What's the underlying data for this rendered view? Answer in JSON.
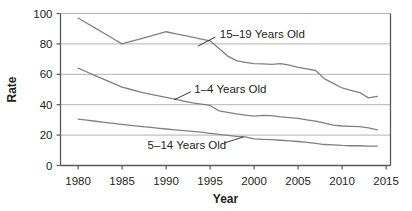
{
  "chart_data": {
    "type": "line",
    "title": "",
    "xlabel": "Year",
    "ylabel": "Rate",
    "xlim": [
      1978,
      2015.5
    ],
    "ylim": [
      0,
      100
    ],
    "xticks": [
      1980,
      1985,
      1990,
      1995,
      2000,
      2005,
      2010,
      2015
    ],
    "xtick_labels": [
      "1980",
      "1985",
      "1990",
      "1995",
      "2000",
      "2005",
      "2010",
      "2015"
    ],
    "yticks": [
      0,
      20,
      40,
      60,
      80,
      100
    ],
    "ytick_labels": [
      "0",
      "20",
      "40",
      "60",
      "80",
      "100"
    ],
    "grid": "horizontal",
    "legend_position": "inline-annotations",
    "line_color": "#808080",
    "grid_color": "#b3b3b3",
    "axis_color": "#58595b",
    "text_color": "#231f20",
    "series": [
      {
        "name": "15–19 Years Old",
        "label": "15–19 Years Old",
        "label_x": 1996.1,
        "label_y": 86.5,
        "leader_from": [
          1995.6,
          84.5
        ],
        "leader_to": [
          1993.6,
          78.5
        ],
        "x": [
          1980,
          1981,
          1982,
          1983,
          1984,
          1985,
          1986,
          1987,
          1988,
          1989,
          1990,
          1991,
          1992,
          1993,
          1994,
          1995,
          1996,
          1997,
          1998,
          1999,
          2000,
          2001,
          2002,
          2003,
          2004,
          2005,
          2006,
          2007,
          2008,
          2009,
          2010,
          2011,
          2012,
          2013,
          2014
        ],
        "y": [
          97,
          93.6,
          90.2,
          86.8,
          83.4,
          80,
          81.6,
          83.2,
          84.8,
          86.4,
          88,
          86.8,
          85.6,
          84.4,
          83.2,
          82,
          77,
          72,
          69,
          67.8,
          67,
          66.8,
          66.5,
          67,
          66,
          64.5,
          63.5,
          62.5,
          57,
          54,
          51,
          49.5,
          48,
          44.5,
          45.5
        ]
      },
      {
        "name": "1–4 Years Old",
        "label": "1–4 Years Old",
        "label_x": 1993.2,
        "label_y": 50.5,
        "leader_from": [
          1992.8,
          48.5
        ],
        "leader_to": [
          1990.9,
          43.2
        ],
        "x": [
          1980,
          1981,
          1982,
          1983,
          1984,
          1985,
          1986,
          1987,
          1988,
          1989,
          1990,
          1991,
          1992,
          1993,
          1994,
          1995,
          1996,
          1997,
          1998,
          1999,
          2000,
          2001,
          2002,
          2003,
          2004,
          2005,
          2006,
          2007,
          2008,
          2009,
          2010,
          2011,
          2012,
          2013,
          2014
        ],
        "y": [
          64,
          61.5,
          59,
          56.5,
          54,
          51.5,
          50,
          48.5,
          47.2,
          46,
          44.8,
          43.6,
          42.4,
          41.2,
          40.4,
          39.5,
          36,
          35,
          34,
          33.2,
          32.5,
          33,
          32.8,
          32,
          31.5,
          31,
          30,
          29.2,
          27.8,
          26.5,
          26,
          25.8,
          25.6,
          24.8,
          23.5
        ]
      },
      {
        "name": "5–14 Years Old",
        "label": "5–14 Years Old",
        "label_x": 1987.9,
        "label_y": 13.5,
        "leader_from": [
          1996.6,
          14.8
        ],
        "leader_to": [
          1998.8,
          18.8
        ],
        "x": [
          1980,
          1981,
          1982,
          1983,
          1984,
          1985,
          1986,
          1987,
          1988,
          1989,
          1990,
          1991,
          1992,
          1993,
          1994,
          1995,
          1996,
          1997,
          1998,
          1999,
          2000,
          2001,
          2002,
          2003,
          2004,
          2005,
          2006,
          2007,
          2008,
          2009,
          2010,
          2011,
          2012,
          2013,
          2014
        ],
        "y": [
          30.5,
          29.8,
          29.1,
          28.4,
          27.7,
          27,
          26.4,
          25.8,
          25.2,
          24.6,
          24,
          23.5,
          23,
          22.5,
          22,
          21.2,
          20.5,
          19.8,
          19.2,
          18.8,
          17.5,
          17.2,
          17,
          16.6,
          16.2,
          15.8,
          15.2,
          14.6,
          13.8,
          13.6,
          13.2,
          13,
          13,
          12.8,
          12.8
        ]
      }
    ]
  }
}
